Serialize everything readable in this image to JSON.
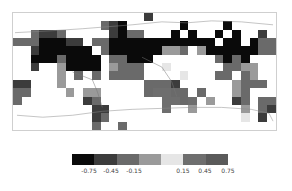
{
  "map": {
    "projection": "equirectangular world map with coastlines",
    "shade_colors": {
      ".": "#ffffff",
      "0": "#0a0a0a",
      "1": "#3c3c3c",
      "2": "#6a6a6a",
      "3": "#9a9a9a",
      "4": "#e6e6e6",
      "5": "#6e6e6e",
      "6": "#5a5a5a"
    },
    "grid_rows": [
      "...............1..............",
      "..........210......0....0.....",
      "..2112.....1022...0.0..0.0..1.",
      "22200011.22000000000000.00.022",
      "..1000000.2000000332.300000022",
      "..00020000.22000.......2020...",
      "..1..30000.3222..4......2233..",
      ".....3.2.2.2222....4...22.23..",
      "11...3.........2221......3222.",
      "22....3.33.....25522.2...32...",
      "2.......12.......5525.3..12.22",
      ".........11......5..3.....3.21",
      ".........12...............4.1.",
      ".........2..2................."
    ]
  },
  "legend": {
    "colors": [
      "#0a0a0a",
      "#3c3c3c",
      "#6a6a6a",
      "#9a9a9a",
      "#e6e6e6",
      "#6e6e6e",
      "#5a5a5a"
    ],
    "labels": [
      {
        "text": "-0.75",
        "x": 17
      },
      {
        "text": "-0.45",
        "x": 39
      },
      {
        "text": "-0.15",
        "x": 62
      },
      {
        "text": "0.15",
        "x": 111
      },
      {
        "text": "0.45",
        "x": 133
      },
      {
        "text": "0.75",
        "x": 156
      }
    ]
  }
}
